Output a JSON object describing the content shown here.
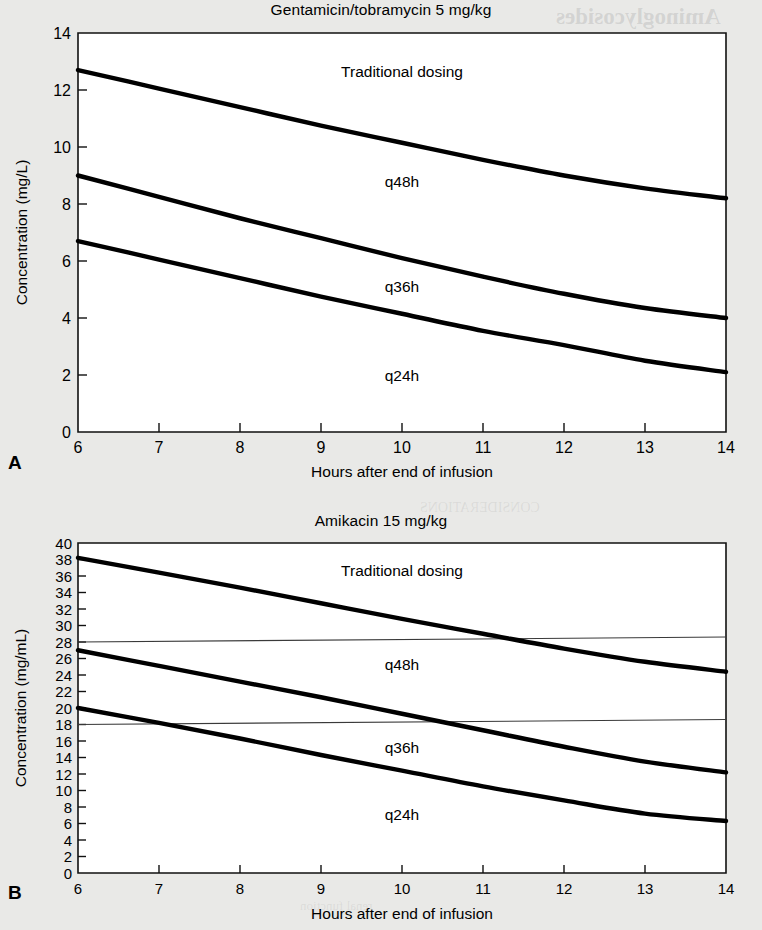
{
  "page": {
    "background_color": "#e9e9e7",
    "plot_background_color": "#ffffff",
    "ink_color": "#000000"
  },
  "figures": [
    {
      "panel_letter": "A",
      "title": "Gentamicin/tobramycin 5 mg/kg"
    },
    {
      "panel_letter": "B",
      "title": "Amikacin 15 mg/kg"
    }
  ],
  "chart_data": [
    {
      "type": "line",
      "panel": "A",
      "title": "Gentamicin/tobramycin 5 mg/kg",
      "xlabel": "Hours after end of infusion",
      "ylabel": "Concentration (mg/L)",
      "xlim": [
        6,
        14
      ],
      "ylim": [
        0,
        14
      ],
      "xticks": [
        6,
        7,
        8,
        9,
        10,
        11,
        12,
        13,
        14
      ],
      "xticklabels": [
        "6",
        "7",
        "8",
        "9",
        "10",
        "11",
        "12",
        "13",
        "14"
      ],
      "yticks": [
        0,
        2,
        4,
        6,
        8,
        10,
        12,
        14
      ],
      "yticklabels": [
        "0",
        "2",
        "4",
        "6",
        "8",
        "10",
        "12",
        "14"
      ],
      "grid": false,
      "legend": "inline-annotations",
      "x": [
        6,
        7,
        8,
        9,
        10,
        11,
        12,
        13,
        14
      ],
      "series": [
        {
          "name": "Traditional dosing",
          "label": "Traditional dosing",
          "label_x": 10.0,
          "label_y": 12.45,
          "values": [
            12.7,
            12.05,
            11.4,
            10.75,
            10.15,
            9.55,
            9.0,
            8.55,
            8.2
          ]
        },
        {
          "name": "q48h",
          "label": "q48h",
          "label_x": 10.0,
          "label_y": 8.6,
          "values": [
            9.0,
            8.25,
            7.5,
            6.8,
            6.1,
            5.45,
            4.85,
            4.35,
            4.0
          ]
        },
        {
          "name": "q36h",
          "label": "q36h",
          "label_x": 10.0,
          "label_y": 4.9,
          "values": [
            6.7,
            6.05,
            5.4,
            4.75,
            4.15,
            3.55,
            3.05,
            2.5,
            2.1
          ]
        },
        {
          "name": "q24h",
          "label": "q24h",
          "label_x": 10.0,
          "label_y": 1.8,
          "values": []
        }
      ],
      "reference_lines": []
    },
    {
      "type": "line",
      "panel": "B",
      "title": "Amikacin 15 mg/kg",
      "xlabel": "Hours after end of infusion",
      "ylabel": "Concentration (mg/mL)",
      "xlim": [
        6,
        14
      ],
      "ylim": [
        0,
        40
      ],
      "xticks": [
        6,
        7,
        8,
        9,
        10,
        11,
        12,
        13,
        14
      ],
      "xticklabels": [
        "6",
        "7",
        "8",
        "9",
        "10",
        "11",
        "12",
        "13",
        "14"
      ],
      "yticks": [
        0,
        2,
        4,
        6,
        8,
        10,
        12,
        14,
        16,
        18,
        20,
        22,
        24,
        26,
        28,
        30,
        32,
        34,
        36,
        38,
        40
      ],
      "yticklabels": [
        "0",
        "2",
        "4",
        "6",
        "8",
        "10",
        "12",
        "14",
        "16",
        "18",
        "20",
        "22",
        "24",
        "26",
        "28",
        "30",
        "32",
        "34",
        "36",
        "38",
        "40"
      ],
      "grid": false,
      "legend": "inline-annotations",
      "x": [
        6,
        7,
        8,
        9,
        10,
        11,
        12,
        13,
        14
      ],
      "series": [
        {
          "name": "Traditional dosing",
          "label": "Traditional dosing",
          "label_x": 10.0,
          "label_y": 36.0,
          "values": [
            38.2,
            36.4,
            34.6,
            32.7,
            30.8,
            29.0,
            27.2,
            25.6,
            24.4
          ]
        },
        {
          "name": "q48h",
          "label": "q48h",
          "label_x": 10.0,
          "label_y": 24.6,
          "values": [
            27.0,
            25.1,
            23.2,
            21.3,
            19.3,
            17.3,
            15.3,
            13.5,
            12.2
          ]
        },
        {
          "name": "q36h",
          "label": "q36h",
          "label_x": 10.0,
          "label_y": 14.6,
          "values": [
            20.0,
            18.2,
            16.3,
            14.3,
            12.4,
            10.5,
            8.8,
            7.2,
            6.3
          ]
        },
        {
          "name": "q24h",
          "label": "q24h",
          "label_x": 10.0,
          "label_y": 6.4,
          "values": []
        }
      ],
      "reference_lines": [
        {
          "name": "upper-reference-line",
          "y_left": 28.0,
          "y_right": 28.6
        },
        {
          "name": "lower-reference-line",
          "y_left": 18.0,
          "y_right": 18.6
        }
      ]
    }
  ],
  "bleed_through_text": [
    {
      "text": "Aminoglycosides",
      "x": 556,
      "y": 4,
      "size": 23
    },
    {
      "text": "GENERAL PRINCIPLES",
      "x": 540,
      "y": 52,
      "size": 16
    },
    {
      "text": "of the dosing interval. A progressively",
      "x": 300,
      "y": 116,
      "size": 13
    },
    {
      "text": "increase in the dose and the interval",
      "x": 300,
      "y": 140,
      "size": 13
    },
    {
      "text": "with renal dysfunction may need",
      "x": 300,
      "y": 164,
      "size": 13
    },
    {
      "text": "concentrations below the target",
      "x": 300,
      "y": 188,
      "size": 13
    },
    {
      "text": "standard dosing regimens.",
      "x": 300,
      "y": 212,
      "size": 13
    },
    {
      "text": "ASSESSMENT",
      "x": 530,
      "y": 296,
      "size": 17
    },
    {
      "text": "the studies in the literature",
      "x": 320,
      "y": 340,
      "size": 13
    },
    {
      "text": "aminoglycoside concentration",
      "x": 320,
      "y": 364,
      "size": 13
    },
    {
      "text": "CONSIDERATIONS",
      "x": 420,
      "y": 500,
      "size": 14
    },
    {
      "text": "the determination of serum",
      "x": 330,
      "y": 560,
      "size": 13
    },
    {
      "text": "Fluoroquinolones",
      "x": 470,
      "y": 718,
      "size": 24
    },
    {
      "text": "GENERAL PRINCIPLES",
      "x": 440,
      "y": 778,
      "size": 15
    },
    {
      "text": "dosing of the",
      "x": 380,
      "y": 826,
      "size": 13
    },
    {
      "text": "renal function",
      "x": 300,
      "y": 898,
      "size": 13
    }
  ]
}
